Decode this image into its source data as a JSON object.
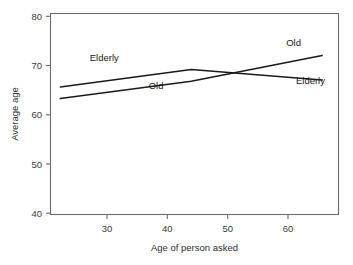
{
  "chart_data": {
    "type": "line",
    "title": "",
    "subtitle": "",
    "xlabel": "Age of person asked",
    "ylabel": "Average age",
    "xlim": [
      23.5,
      67.5
    ],
    "ylim": [
      38.5,
      81.5
    ],
    "xticks": [
      30,
      40,
      50,
      60
    ],
    "xtick_labels": [
      "30",
      "40",
      "50",
      "60"
    ],
    "yticks": [
      40,
      50,
      60,
      70,
      80
    ],
    "ytick_labels": [
      "40",
      "50",
      "60",
      "70",
      "80"
    ],
    "grid": false,
    "legend": "inline-labels",
    "series": [
      {
        "name": "Elderly",
        "x": [
          25,
          45,
          65
        ],
        "values": [
          65.8,
          69.5,
          67.3
        ]
      },
      {
        "name": "Old",
        "x": [
          25,
          45,
          65
        ],
        "values": [
          63.3,
          67.0,
          72.5
        ]
      }
    ],
    "annotations": [
      {
        "text": "Elderly",
        "x": 29.5,
        "y": 71.4,
        "series": "Elderly",
        "side": "left"
      },
      {
        "text": "Old",
        "x": 38.5,
        "y": 65.4,
        "series": "Old",
        "side": "left"
      },
      {
        "text": "Old",
        "x": 59.5,
        "y": 74.6,
        "series": "Old",
        "side": "right"
      },
      {
        "text": "Elderly",
        "x": 61.0,
        "y": 66.5,
        "series": "Elderly",
        "side": "right"
      }
    ],
    "crossing_point": {
      "x": 51.5,
      "y": 68.8
    }
  },
  "axes": {
    "x_title": "Age of person asked",
    "y_title": "Average age",
    "x_tick_labels": [
      "30",
      "40",
      "50",
      "60"
    ],
    "y_tick_labels": [
      "80",
      "70",
      "60",
      "50",
      "40"
    ]
  },
  "labels": {
    "elderly_left": "Elderly",
    "old_left": "Old",
    "old_right": "Old",
    "elderly_right": "Elderly"
  },
  "colors": {
    "line": "#1a1a1a",
    "axis": "#6b6b6b",
    "text": "#2e2e2e",
    "background": "#ffffff"
  }
}
